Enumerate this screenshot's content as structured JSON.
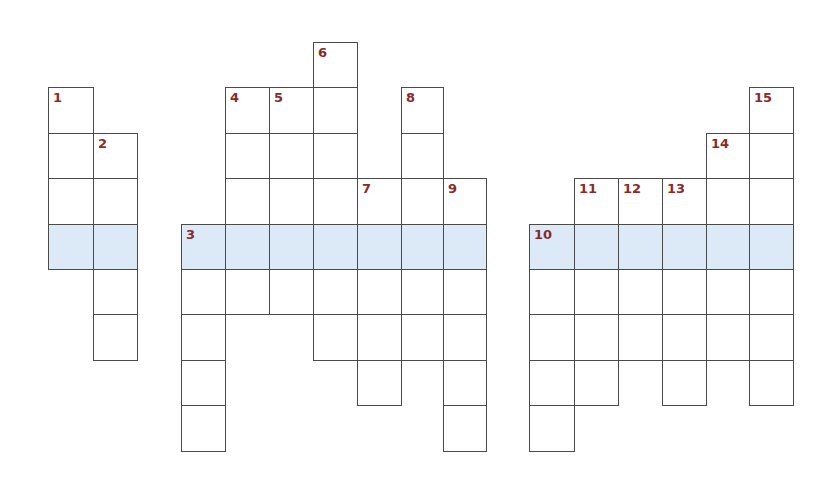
{
  "puzzle": {
    "type": "crossword",
    "highlight_color": "#dce9f7",
    "label_color": "#8b2a2a",
    "line_color": "#4a4a4a",
    "row_y": [
      42,
      87,
      133,
      178,
      224,
      269,
      314,
      360,
      405,
      451
    ],
    "highlight_row": 4,
    "blocks": [
      {
        "name": "left-block",
        "col_x": [
          48,
          93,
          137
        ],
        "cells": [
          {
            "r": 1,
            "c": 0,
            "n": "1"
          },
          {
            "r": 2,
            "c": 0
          },
          {
            "r": 2,
            "c": 1,
            "n": "2"
          },
          {
            "r": 3,
            "c": 0
          },
          {
            "r": 3,
            "c": 1
          },
          {
            "r": 4,
            "c": 0
          },
          {
            "r": 4,
            "c": 1
          },
          {
            "r": 5,
            "c": 1
          },
          {
            "r": 6,
            "c": 1
          }
        ]
      },
      {
        "name": "middle-block",
        "col_x": [
          181,
          225,
          269,
          313,
          357,
          401,
          443,
          486
        ],
        "cells": [
          {
            "r": 0,
            "c": 3,
            "n": "6"
          },
          {
            "r": 1,
            "c": 1,
            "n": "4"
          },
          {
            "r": 1,
            "c": 2,
            "n": "5"
          },
          {
            "r": 1,
            "c": 3
          },
          {
            "r": 1,
            "c": 5,
            "n": "8"
          },
          {
            "r": 2,
            "c": 1
          },
          {
            "r": 2,
            "c": 2
          },
          {
            "r": 2,
            "c": 3
          },
          {
            "r": 2,
            "c": 5
          },
          {
            "r": 3,
            "c": 1
          },
          {
            "r": 3,
            "c": 2
          },
          {
            "r": 3,
            "c": 3
          },
          {
            "r": 3,
            "c": 4,
            "n": "7"
          },
          {
            "r": 3,
            "c": 5
          },
          {
            "r": 3,
            "c": 6,
            "n": "9"
          },
          {
            "r": 4,
            "c": 0,
            "n": "3"
          },
          {
            "r": 4,
            "c": 1
          },
          {
            "r": 4,
            "c": 2
          },
          {
            "r": 4,
            "c": 3
          },
          {
            "r": 4,
            "c": 4
          },
          {
            "r": 4,
            "c": 5
          },
          {
            "r": 4,
            "c": 6
          },
          {
            "r": 5,
            "c": 0
          },
          {
            "r": 5,
            "c": 1
          },
          {
            "r": 5,
            "c": 2
          },
          {
            "r": 5,
            "c": 3
          },
          {
            "r": 5,
            "c": 4
          },
          {
            "r": 5,
            "c": 5
          },
          {
            "r": 5,
            "c": 6
          },
          {
            "r": 6,
            "c": 0
          },
          {
            "r": 6,
            "c": 3
          },
          {
            "r": 6,
            "c": 4
          },
          {
            "r": 6,
            "c": 5
          },
          {
            "r": 6,
            "c": 6
          },
          {
            "r": 7,
            "c": 0
          },
          {
            "r": 7,
            "c": 4
          },
          {
            "r": 7,
            "c": 6
          },
          {
            "r": 8,
            "c": 0
          },
          {
            "r": 8,
            "c": 6
          }
        ]
      },
      {
        "name": "right-block",
        "col_x": [
          529,
          574,
          618,
          662,
          706,
          749,
          793
        ],
        "cells": [
          {
            "r": 1,
            "c": 5,
            "n": "15"
          },
          {
            "r": 2,
            "c": 4,
            "n": "14"
          },
          {
            "r": 2,
            "c": 5
          },
          {
            "r": 3,
            "c": 1,
            "n": "11"
          },
          {
            "r": 3,
            "c": 2,
            "n": "12"
          },
          {
            "r": 3,
            "c": 3,
            "n": "13"
          },
          {
            "r": 3,
            "c": 4
          },
          {
            "r": 3,
            "c": 5
          },
          {
            "r": 4,
            "c": 0,
            "n": "10"
          },
          {
            "r": 4,
            "c": 1
          },
          {
            "r": 4,
            "c": 2
          },
          {
            "r": 4,
            "c": 3
          },
          {
            "r": 4,
            "c": 4
          },
          {
            "r": 4,
            "c": 5
          },
          {
            "r": 5,
            "c": 0
          },
          {
            "r": 5,
            "c": 1
          },
          {
            "r": 5,
            "c": 2
          },
          {
            "r": 5,
            "c": 3
          },
          {
            "r": 5,
            "c": 4
          },
          {
            "r": 5,
            "c": 5
          },
          {
            "r": 6,
            "c": 0
          },
          {
            "r": 6,
            "c": 1
          },
          {
            "r": 6,
            "c": 2
          },
          {
            "r": 6,
            "c": 3
          },
          {
            "r": 6,
            "c": 4
          },
          {
            "r": 6,
            "c": 5
          },
          {
            "r": 7,
            "c": 0
          },
          {
            "r": 7,
            "c": 1
          },
          {
            "r": 7,
            "c": 3
          },
          {
            "r": 7,
            "c": 5
          },
          {
            "r": 8,
            "c": 0
          }
        ]
      }
    ]
  }
}
